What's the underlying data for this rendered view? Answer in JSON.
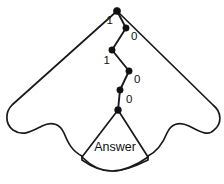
{
  "figure": {
    "name": "binary-decision-path-fan",
    "background_color": "#ffffff",
    "stroke_color": "#1a1a1a",
    "node_color": "#111111",
    "width": 224,
    "height": 184
  },
  "answer": {
    "label": "Answer"
  },
  "tree": {
    "nodes": [
      {
        "id": "n0",
        "x": 117,
        "y": 11
      },
      {
        "id": "n1",
        "x": 126,
        "y": 28
      },
      {
        "id": "n2",
        "x": 112,
        "y": 50
      },
      {
        "id": "n3",
        "x": 129,
        "y": 71
      },
      {
        "id": "n4",
        "x": 120,
        "y": 90
      },
      {
        "id": "n5",
        "x": 118,
        "y": 110
      }
    ],
    "edges": [
      {
        "from": "n0",
        "to": "n1",
        "label": "1",
        "label_x": 113,
        "label_y": 21,
        "anchor": "end"
      },
      {
        "from": "n1",
        "to": "n2",
        "label": "0",
        "label_x": 131,
        "label_y": 37,
        "anchor": "start"
      },
      {
        "from": "n2",
        "to": "n3",
        "label": "1",
        "label_x": 110,
        "label_y": 61,
        "anchor": "end"
      },
      {
        "from": "n3",
        "to": "n4",
        "label": "0",
        "label_x": 134,
        "label_y": 80,
        "anchor": "start"
      },
      {
        "from": "n4",
        "to": "n5",
        "label": "0",
        "label_x": 126,
        "label_y": 100,
        "anchor": "start"
      }
    ]
  },
  "boundary": {
    "apex_x": 117,
    "apex_y": 11,
    "left_shoulder_x": 12,
    "left_shoulder_y": 105,
    "right_shoulder_x": 213,
    "right_shoulder_y": 105
  }
}
